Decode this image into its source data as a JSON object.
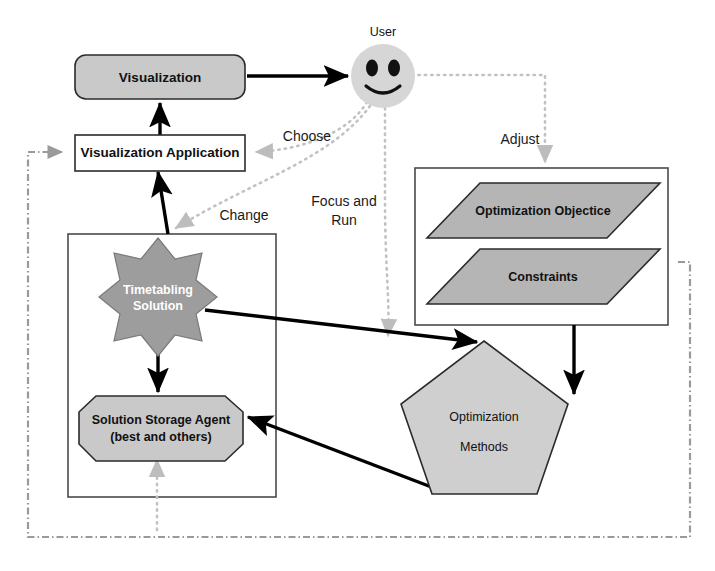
{
  "diagram": {
    "nodes": {
      "visualization": {
        "label": "Visualization",
        "shape": "rounded-rect",
        "fill": "#c9c9c9"
      },
      "visualization_application": {
        "label": "Visualization Application",
        "shape": "rect",
        "fill": "#ffffff"
      },
      "user": {
        "label": "User",
        "shape": "smiley-face",
        "fill": "#d6d6d6"
      },
      "timetabling_solution": {
        "label_line1": "Timetabling",
        "label_line2": "Solution",
        "shape": "8-point-star",
        "fill": "#9d9d9d",
        "text_color": "#ffffff"
      },
      "solution_storage_agent": {
        "label_line1": "Solution Storage Agent",
        "label_line2": "(best and others)",
        "shape": "octagon",
        "fill": "#c9c9c9"
      },
      "optimization_objective": {
        "label": "Optimization Objectice",
        "shape": "parallelogram",
        "fill": "#b5b5b5"
      },
      "constraints": {
        "label": "Constraints",
        "shape": "parallelogram",
        "fill": "#b5b5b5"
      },
      "optimization_methods": {
        "label_line1": "Optimization",
        "label_line2": "Methods",
        "shape": "pentagon",
        "fill": "#cfcfcf"
      }
    },
    "flow_labels": {
      "choose": "Choose",
      "adjust": "Adjust",
      "focus_and_run_line1": "Focus and",
      "focus_and_run_line2": "Run",
      "change": "Change"
    },
    "colors": {
      "node_gray": "#c9c9c9",
      "star_gray": "#9d9d9d",
      "plane_gray": "#b5b5b5",
      "pentagon_gray": "#cfcfcf",
      "face_gray": "#d6d6d6",
      "solid_edge": "#000000",
      "dotted_edge": "#c2c2c2",
      "dashed_edge": "#9a9a9a"
    }
  }
}
